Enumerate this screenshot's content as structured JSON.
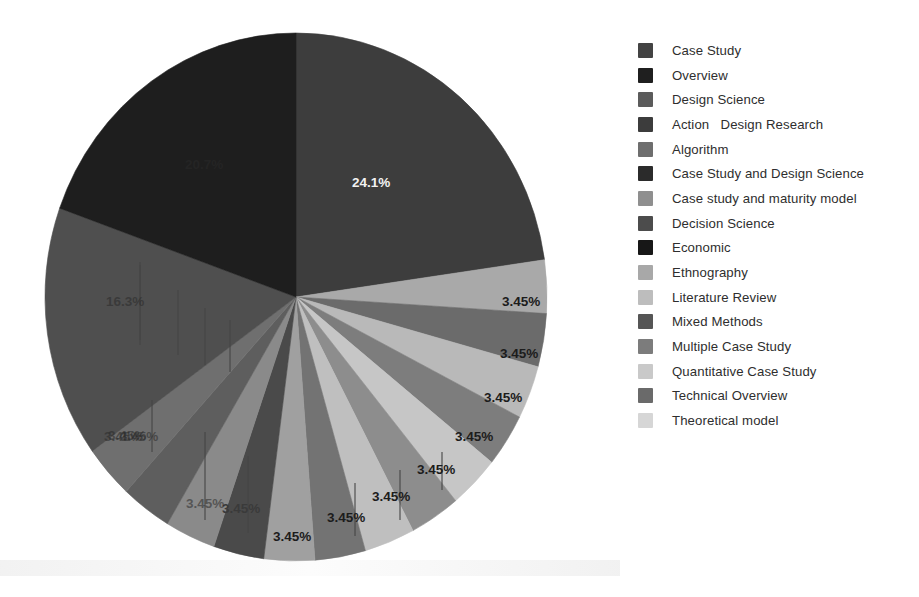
{
  "chart_data": {
    "type": "pie",
    "title": "",
    "legend_position": "right",
    "start_angle_deg": 0,
    "direction": "clockwise",
    "labels_format": "percent",
    "categories": [
      "Case Study",
      "Overview",
      "Design Science",
      "Action   Design Research",
      "Algorithm",
      "Case Study and Design Science",
      "Case study and maturity model",
      "Decision Science",
      "Economic",
      "Ethnography",
      "Literature Review",
      "Mixed Methods",
      "Multiple Case Study",
      "Quantitative Case Study",
      "Technical Overview",
      "Theoretical model"
    ],
    "values": [
      24.1,
      3.45,
      3.45,
      3.45,
      3.45,
      3.45,
      3.45,
      3.45,
      3.45,
      3.45,
      3.45,
      3.45,
      3.45,
      3.45,
      16.3,
      20.7
    ],
    "value_labels": [
      "24.1%",
      "3.45%",
      "3.45%",
      "3.45%",
      "3.45%",
      "3.45%",
      "3.45%",
      "3.45%",
      "3.45%",
      "3.45%",
      "3.45%",
      "3.45%",
      "3.45%",
      "3.45%",
      "16.3%",
      "20.7%"
    ],
    "colors": [
      "#434343",
      "#1f1f1f",
      "#5b5b5b",
      "#3c3c3c",
      "#6e6e6e",
      "#2b2b2b",
      "#8f8f8f",
      "#4c4c4c",
      "#171717",
      "#a8a8a8",
      "#bdbdbd",
      "#555555",
      "#7c7c7c",
      "#c9c9c9",
      "#6a6a6a",
      "#d6d6d6"
    ],
    "slice_colors_drawn": [
      "#3d3d3d",
      "#a9a9a9",
      "#6b6b6b",
      "#b9b9b9",
      "#7d7d7d",
      "#c6c6c6",
      "#8d8d8d",
      "#bfbfbf",
      "#737373",
      "#a0a0a0",
      "#4a4a4a",
      "#8a8a8a",
      "#5e5e5e",
      "#6f6f6f",
      "#4f4f4f",
      "#1e1e1e"
    ]
  },
  "legend": {
    "items": [
      {
        "label": "Case Study",
        "color": "#434343"
      },
      {
        "label": "Overview",
        "color": "#1f1f1f"
      },
      {
        "label": "Design Science",
        "color": "#5b5b5b"
      },
      {
        "label": "Action   Design Research",
        "color": "#3c3c3c"
      },
      {
        "label": "Algorithm",
        "color": "#6e6e6e"
      },
      {
        "label": "Case Study and Design Science",
        "color": "#2b2b2b"
      },
      {
        "label": "Case study and maturity model",
        "color": "#8f8f8f"
      },
      {
        "label": "Decision Science",
        "color": "#4c4c4c"
      },
      {
        "label": "Economic",
        "color": "#171717"
      },
      {
        "label": "Ethnography",
        "color": "#a8a8a8"
      },
      {
        "label": "Literature Review",
        "color": "#bdbdbd"
      },
      {
        "label": "Mixed Methods",
        "color": "#555555"
      },
      {
        "label": "Multiple Case Study",
        "color": "#7c7c7c"
      },
      {
        "label": "Quantitative Case Study",
        "color": "#c9c9c9"
      },
      {
        "label": "Technical Overview",
        "color": "#6a6a6a"
      },
      {
        "label": "Theoretical model",
        "color": "#d6d6d6"
      }
    ]
  },
  "pie_geometry": {
    "center_x": 296,
    "center_y": 297,
    "radius_x": 251,
    "radius_y": 264
  },
  "slice_labels": [
    {
      "text": "24.1%",
      "x": 352,
      "y": 183,
      "style": "lbl-light",
      "leader": null
    },
    {
      "text": "3.45%",
      "x": 502,
      "y": 302,
      "style": "lbl-dark",
      "leader": null
    },
    {
      "text": "3.45%",
      "x": 500,
      "y": 354,
      "style": "lbl-dark",
      "leader": null
    },
    {
      "text": "3.45%",
      "x": 484,
      "y": 398,
      "style": "lbl-dark",
      "leader": null
    },
    {
      "text": "3.45%",
      "x": 455,
      "y": 437,
      "style": "lbl-dark",
      "leader": null
    },
    {
      "text": "3.45%",
      "x": 417,
      "y": 470,
      "style": "lbl-dark",
      "leader": {
        "x": 442,
        "y1": 452,
        "y2": 490
      }
    },
    {
      "text": "3.45%",
      "x": 372,
      "y": 497,
      "style": "lbl-dark",
      "leader": {
        "x": 400,
        "y1": 470,
        "y2": 520
      }
    },
    {
      "text": "3.45%",
      "x": 327,
      "y": 518,
      "style": "lbl-dark",
      "leader": {
        "x": 355,
        "y1": 483,
        "y2": 536
      }
    },
    {
      "text": "3.45%",
      "x": 273,
      "y": 537,
      "style": "lbl-dark",
      "leader": null
    },
    {
      "text": "3.45%",
      "x": 222,
      "y": 509,
      "style": "lbl-faint",
      "leader": {
        "x": 248,
        "y1": 456,
        "y2": 533
      }
    },
    {
      "text": "3.45%",
      "x": 186,
      "y": 504,
      "style": "lbl-vfaint",
      "leader": {
        "x": 205,
        "y1": 432,
        "y2": 520
      }
    },
    {
      "text": "3.45%",
      "x": 120,
      "y": 437,
      "style": "lbl-vfaint",
      "leader": {
        "x": 152,
        "y1": 400,
        "y2": 452
      }
    },
    {
      "text": "3.45%",
      "x": 108,
      "y": 436,
      "style": "lbl-vfaint",
      "leader": null
    },
    {
      "text": "3.45%",
      "x": 104,
      "y": 437,
      "style": "lbl-vfaint",
      "leader": null
    },
    {
      "text": "16.3%",
      "x": 106,
      "y": 302,
      "style": "lbl-vfaint",
      "leader": {
        "x": 140,
        "y1": 265,
        "y2": 340
      }
    },
    {
      "text": "20.7%",
      "x": 185,
      "y": 165,
      "style": "lbl-vfaint",
      "leader": null
    }
  ],
  "leader_lines": [
    {
      "x": 140,
      "y1": 262,
      "y2": 345
    },
    {
      "x": 178,
      "y1": 290,
      "y2": 355
    },
    {
      "x": 205,
      "y1": 308,
      "y2": 365
    },
    {
      "x": 230,
      "y1": 320,
      "y2": 372
    }
  ]
}
